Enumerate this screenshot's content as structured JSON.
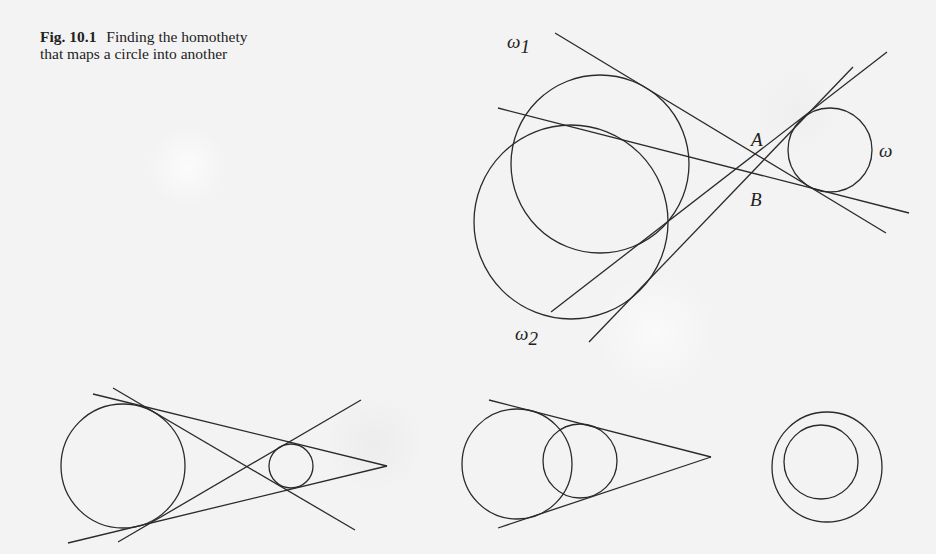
{
  "caption": {
    "figure_number": "Fig. 10.1",
    "text": "Finding the homothety that maps a circle into another"
  },
  "labels": {
    "omega1": {
      "symbol": "ω",
      "subscript": "1"
    },
    "omega2": {
      "symbol": "ω",
      "subscript": "2"
    },
    "omega": {
      "symbol": "ω"
    },
    "A": "A",
    "B": "B"
  },
  "diagrams": {
    "top": {
      "circles": [
        {
          "name": "omega1",
          "cx": 600,
          "cy": 164,
          "r": 89
        },
        {
          "name": "omega2",
          "cx": 571,
          "cy": 222,
          "r": 97
        },
        {
          "name": "omega",
          "cx": 830,
          "cy": 150,
          "r": 42
        }
      ],
      "lines": [
        {
          "x1": 555,
          "y1": 33,
          "x2": 886,
          "y2": 233
        },
        {
          "x1": 498,
          "y1": 108,
          "x2": 909,
          "y2": 213
        },
        {
          "x1": 551,
          "y1": 312,
          "x2": 887,
          "y2": 52
        },
        {
          "x1": 589,
          "y1": 342,
          "x2": 853,
          "y2": 67
        }
      ]
    },
    "bottom_left": {
      "circles": [
        {
          "cx": 123,
          "cy": 466,
          "r": 62
        },
        {
          "cx": 291,
          "cy": 466,
          "r": 22
        }
      ],
      "lines": [
        {
          "x1": 93,
          "y1": 394,
          "x2": 387,
          "y2": 466
        },
        {
          "x1": 68,
          "y1": 543,
          "x2": 387,
          "y2": 466
        },
        {
          "x1": 113,
          "y1": 388,
          "x2": 355,
          "y2": 530
        },
        {
          "x1": 118,
          "y1": 542,
          "x2": 361,
          "y2": 400
        }
      ]
    },
    "bottom_middle": {
      "circles": [
        {
          "cx": 517,
          "cy": 464,
          "r": 55
        },
        {
          "cx": 580,
          "cy": 461,
          "r": 37
        }
      ],
      "lines": [
        {
          "x1": 489,
          "y1": 400,
          "x2": 711,
          "y2": 457
        },
        {
          "x1": 498,
          "y1": 528,
          "x2": 711,
          "y2": 457
        }
      ]
    },
    "bottom_right": {
      "circles": [
        {
          "cx": 827,
          "cy": 467,
          "r": 55
        },
        {
          "cx": 821,
          "cy": 462,
          "r": 37
        }
      ]
    }
  }
}
